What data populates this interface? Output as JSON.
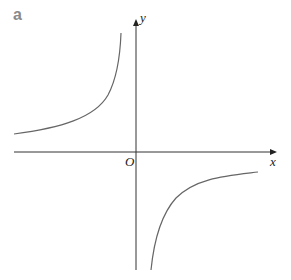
{
  "panel_label": "a",
  "axes": {
    "x_label": "x",
    "y_label": "y",
    "origin_label": "O"
  },
  "curve": {
    "description": "rectangular hyperbola y = -k/x, branches in 2nd and 4th quadrants",
    "color": "#666666"
  }
}
